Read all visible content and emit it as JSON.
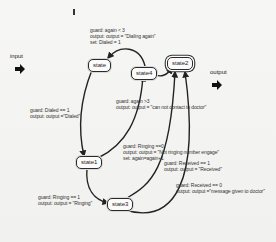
{
  "diagram": {
    "type": "state-machine",
    "ports": {
      "input": {
        "label": "input",
        "icon": "input-arrow-icon"
      },
      "output": {
        "label": "output",
        "icon": "output-arrow-icon"
      }
    },
    "states": [
      {
        "id": "state",
        "label": "state"
      },
      {
        "id": "state4",
        "label": "state4"
      },
      {
        "id": "state2",
        "label": "state2",
        "final": true
      },
      {
        "id": "state1",
        "label": "state1"
      },
      {
        "id": "state3",
        "label": "state3"
      }
    ],
    "transitions": [
      {
        "from": "state4",
        "to": "state",
        "guard_label": "guard: again < 3",
        "output_label": "output: output = \"Dialing again\"",
        "set_label": "set: Dialed = 1"
      },
      {
        "from": "state4",
        "to": "state2",
        "guard_label": "guard: again >3",
        "output_label": "output: output = \"can not contact to doctor\""
      },
      {
        "from": "state",
        "to": "state1",
        "guard_label": "guard: Dialed == 1",
        "output_label": "output: output =\"Dialed\""
      },
      {
        "from": "state1",
        "to": "state4",
        "guard_label": "guard: Ringing ==0",
        "output_label": "output: output = \"Not ringing number engage\"",
        "set_label": "set: again=again+1"
      },
      {
        "from": "state1",
        "to": "state3",
        "guard_label": "guard: Ringing == 1",
        "output_label": "output: output = \"Ringing\""
      },
      {
        "from": "state3",
        "to": "state2",
        "guard_label": "guard: Received == 1",
        "output_label": "output: output = \"Received\""
      },
      {
        "from": "state3",
        "to": "state2",
        "guard_label": "guard: Received == 0",
        "output_label": "output: output =\"message given to doctor\""
      }
    ]
  }
}
